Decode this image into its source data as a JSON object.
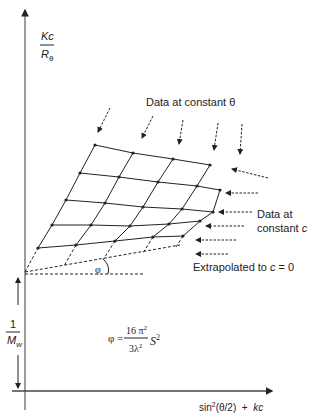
{
  "diagram": {
    "type": "Zimm plot",
    "y_axis": {
      "numerator": "Kc",
      "denominator": "R",
      "denominator_sub": "θ"
    },
    "x_axis": {
      "label_pre": "sin",
      "label_sup": "2",
      "label_mid": "(θ/2)  +  ",
      "label_k": "kc"
    },
    "intercept_label": {
      "numerator": "1",
      "denominator": "M",
      "denominator_sub": "w"
    },
    "annotations": {
      "constant_theta": "Data at constant θ",
      "constant_c_line1": "Data at",
      "constant_c_line2": "constant ",
      "constant_c_var": "c",
      "extrapolated_pre": "Extrapolated to ",
      "extrapolated_var": "c",
      "extrapolated_post": " = 0",
      "angle_symbol": "φ"
    },
    "formula": {
      "lhs": "φ =",
      "num": "16 π",
      "num_sup": "2",
      "den": "3λ",
      "den_sup": "2",
      "rhs": "S",
      "rhs_sup": "2"
    },
    "colors": {
      "line": "#222222",
      "axis": "#555555"
    }
  }
}
